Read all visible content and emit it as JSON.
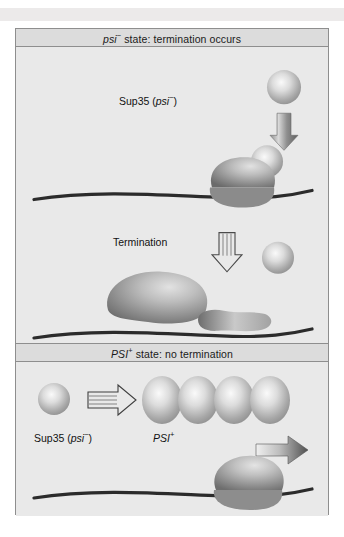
{
  "figure": {
    "panels": [
      {
        "id": "psi-minus",
        "title_prefix": "psi",
        "title_sup": "−",
        "title_rest": " state: termination occurs",
        "title_full": "psi− state: termination occurs",
        "labels": {
          "sup35": "Sup35 (",
          "sup35_italic": "psi",
          "sup35_sup": "−",
          "sup35_close": ")",
          "termination": "Termination"
        }
      },
      {
        "id": "psi-plus",
        "title_prefix": "PSI",
        "title_sup": "+",
        "title_rest": " state: no termination",
        "title_full": "PSI+ state: no termination",
        "labels": {
          "sup35": "Sup35 (",
          "sup35_italic": "psi",
          "sup35_sup": "−",
          "sup35_close": ")",
          "aggregate_italic": "PSI",
          "aggregate_sup": "+"
        }
      }
    ],
    "colors": {
      "page_background": "#ffffff",
      "top_band": "#eceaea",
      "panel_background": "#e9e9e9",
      "title_bar": "#dcdcdc",
      "frame_border": "#8e8e8e",
      "sphere_highlight": "#f4f4f4",
      "sphere_edge": "#9a9a9a",
      "ribosome_light": "#cfcfcf",
      "ribosome_dark": "#6e6e6e",
      "mrna_line": "#2b2b2b",
      "arrow_fill_light": "#e3e3e3",
      "arrow_fill_dark": "#5a5a5a",
      "text": "#111111"
    },
    "shapes": {
      "spheres": [
        {
          "name": "sup35-monomer-top",
          "cx": 268,
          "cy": 57,
          "r": 17
        },
        {
          "name": "sup35-monomer-on-ribosome",
          "cx": 251,
          "cy": 131,
          "r": 16
        },
        {
          "name": "sup35-released",
          "cx": 262,
          "cy": 227,
          "r": 16
        },
        {
          "name": "sup35-monomer-bottom",
          "cx": 38,
          "cy": 49,
          "r": 16
        }
      ],
      "arrows": [
        {
          "name": "arrow-down-solid-top",
          "direction": "down",
          "style": "solid-gradient"
        },
        {
          "name": "arrow-down-hollow-termination",
          "direction": "down",
          "style": "hollow-outline"
        },
        {
          "name": "arrow-right-hollow-aggregation",
          "direction": "right",
          "style": "hollow-outline"
        },
        {
          "name": "arrow-right-solid-readthrough",
          "direction": "right",
          "style": "solid-gradient"
        }
      ],
      "mrna_lines": [
        {
          "name": "mrna-strand-1",
          "panel": "psi-minus"
        },
        {
          "name": "mrna-strand-2",
          "panel": "psi-minus"
        },
        {
          "name": "mrna-strand-3",
          "panel": "psi-plus"
        }
      ],
      "ribosomes": [
        {
          "name": "ribosome-terminating",
          "panel": "psi-minus"
        },
        {
          "name": "ribosome-released-large",
          "panel": "psi-minus"
        },
        {
          "name": "ribosome-small-subunit",
          "panel": "psi-minus"
        },
        {
          "name": "ribosome-reading-through",
          "panel": "psi-plus"
        }
      ],
      "aggregate": {
        "name": "psi-plus-prion-aggregate",
        "unit_count": 4
      }
    }
  }
}
